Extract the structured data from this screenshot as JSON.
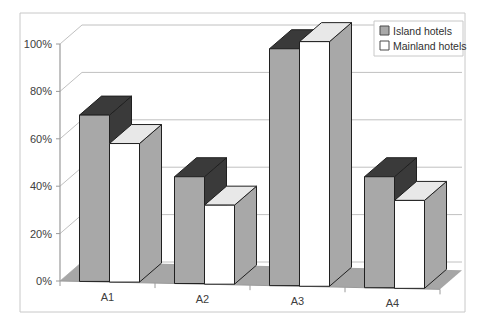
{
  "chart_data": {
    "type": "bar",
    "title": "",
    "xlabel": "",
    "ylabel": "",
    "categories": [
      "A1",
      "A2",
      "A3",
      "A4"
    ],
    "series": [
      {
        "name": "Island hotels",
        "values": [
          70,
          44,
          98,
          44
        ],
        "color": "#a8a8a8"
      },
      {
        "name": "Mainland hotels",
        "values": [
          58,
          32,
          101,
          34
        ],
        "color": "#ffffff"
      }
    ],
    "ylim": [
      0,
      100
    ],
    "yticks": [
      0,
      20,
      40,
      60,
      80,
      100
    ],
    "ytick_labels": [
      "0%",
      "20%",
      "40%",
      "60%",
      "80%",
      "100%"
    ],
    "grid": true,
    "legend_position": "top-right",
    "three_d": true
  },
  "legend": {
    "items": [
      {
        "label": "Island hotels",
        "swatch": "#a8a8a8"
      },
      {
        "label": "Mainland hotels",
        "swatch": "#ffffff"
      }
    ]
  },
  "style": {
    "frame_border": "#c8c8c8",
    "plot_background": "#ffffff",
    "floor_color": "#a6a6a6",
    "gridline_color": "#c0c0c0",
    "axis_color": "#9a9a9a",
    "bar_edge": "#202020",
    "island_front": "#a8a8a8",
    "island_top": "#3a3a3a",
    "island_side": "#3a3a3a",
    "mainland_front": "#ffffff",
    "mainland_top": "#e8e8e8",
    "mainland_side": "#a8a8a8"
  }
}
